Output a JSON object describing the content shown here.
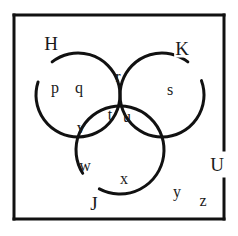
{
  "figure": {
    "type": "venn-diagram",
    "background_color": "#ffffff",
    "stroke_color": "#111111",
    "universe": {
      "label": "U",
      "label_x": 217,
      "label_y": 164,
      "rect": {
        "x": 14,
        "y": 15,
        "width": 210,
        "height": 204
      },
      "border_width": 3,
      "border_gap": {
        "edge": "right",
        "from_y": 150,
        "to_y": 179
      }
    },
    "circles": [
      {
        "label": "H",
        "cx": 78,
        "cy": 95,
        "r": 42,
        "stroke_width": 3,
        "label_x": 51,
        "label_y": 43,
        "gap_start_deg": 198,
        "gap_end_deg": 232
      },
      {
        "label": "K",
        "cx": 162,
        "cy": 95,
        "r": 42,
        "stroke_width": 3,
        "label_x": 182,
        "label_y": 48,
        "gap_start_deg": 308,
        "gap_end_deg": 340
      },
      {
        "label": "J",
        "cx": 120,
        "cy": 150,
        "r": 44,
        "stroke_width": 3,
        "label_x": 94,
        "label_y": 203,
        "gap_start_deg": 118,
        "gap_end_deg": 148
      }
    ],
    "elements": [
      {
        "text": "p",
        "x": 55,
        "y": 88,
        "region": "H only"
      },
      {
        "text": "q",
        "x": 79,
        "y": 88,
        "region": "H only"
      },
      {
        "text": "r",
        "x": 118,
        "y": 77,
        "region": "H and K"
      },
      {
        "text": "s",
        "x": 170,
        "y": 90,
        "region": "K only"
      },
      {
        "text": "t",
        "x": 110,
        "y": 115,
        "region": "H and K and J"
      },
      {
        "text": "u",
        "x": 127,
        "y": 117,
        "region": "H and K and J"
      },
      {
        "text": "v",
        "x": 81,
        "y": 128,
        "region": "H and J"
      },
      {
        "text": "w",
        "x": 85,
        "y": 166,
        "region": "J only"
      },
      {
        "text": "x",
        "x": 124,
        "y": 179,
        "region": "J only"
      },
      {
        "text": "y",
        "x": 177,
        "y": 192,
        "region": "outside circles"
      },
      {
        "text": "z",
        "x": 203,
        "y": 201,
        "region": "outside circles"
      }
    ]
  }
}
